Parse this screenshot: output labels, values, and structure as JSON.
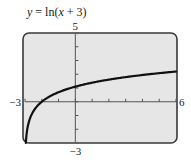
{
  "chart_data": {
    "type": "line",
    "title": "y = ln(x + 3)",
    "title_parts": {
      "lhs": "y",
      "eq": " = ln(",
      "var": "x",
      "rest": " + 3)"
    },
    "function": "ln(x + 3)",
    "xlabel": "",
    "ylabel": "",
    "xlim": [
      -3,
      6
    ],
    "ylim": [
      -3,
      5
    ],
    "x_ticks_step": 1,
    "y_ticks_step": 1,
    "tick_labels": {
      "xmin": "−3",
      "xmax": "6",
      "ymin": "−3",
      "ymax": "5"
    },
    "grid": false,
    "series": [
      {
        "name": "y = ln(x + 3)",
        "x": [
          -2.95,
          -2.9,
          -2.8,
          -2.5,
          -2,
          -1,
          0,
          1,
          2,
          3,
          4,
          5,
          6
        ],
        "y": [
          -3.0,
          -2.303,
          -1.609,
          -0.693,
          0,
          0.693,
          1.099,
          1.386,
          1.609,
          1.792,
          1.946,
          2.079,
          2.197
        ]
      }
    ],
    "colors": {
      "background": "#e6e6e6",
      "frame": "#3a3a3a",
      "axes": "#555555",
      "curve": "#111111"
    }
  }
}
